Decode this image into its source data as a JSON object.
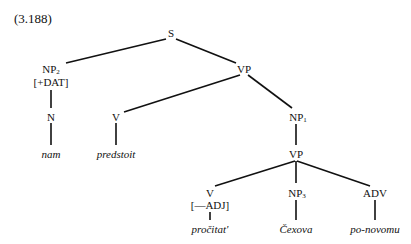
{
  "example_number": "(3.188)",
  "nodes": {
    "s": {
      "label": "S"
    },
    "np2": {
      "label": "NP",
      "sub": "2",
      "feature": "[+DAT]"
    },
    "vp_top": {
      "label": "VP"
    },
    "n": {
      "label": "N"
    },
    "v_top": {
      "label": "V"
    },
    "np1": {
      "label": "NP",
      "sub": "1"
    },
    "vp_low": {
      "label": "VP"
    },
    "v_low": {
      "label": "V",
      "feature": "[—ADJ]"
    },
    "np3": {
      "label": "NP",
      "sub": "3"
    },
    "adv": {
      "label": "ADV"
    }
  },
  "leaves": {
    "nam": "nam",
    "predstoit": "predstoit",
    "procitat": "pročitat'",
    "cexova": "Čexova",
    "ponovomu": "po-novomu"
  },
  "colors": {
    "line": "#111111",
    "text": "#111111",
    "background": "#ffffff"
  }
}
